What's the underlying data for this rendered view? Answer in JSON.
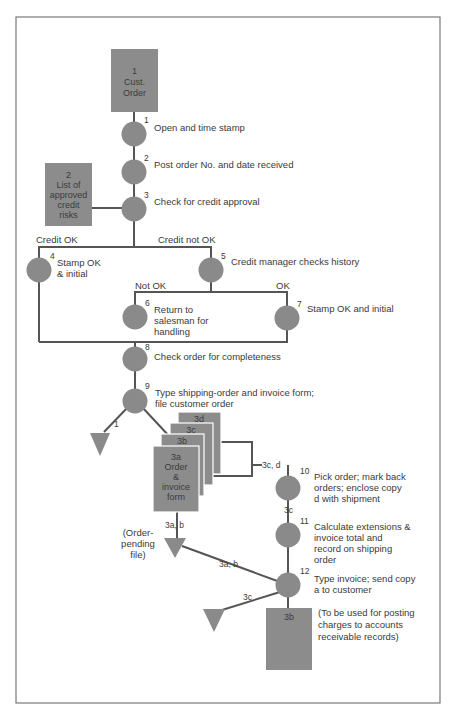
{
  "documents": {
    "cust_order": {
      "number": "1",
      "line1": "Cust.",
      "line2": "Order"
    },
    "credit_list": {
      "number": "2",
      "lines": [
        "List of",
        "approved",
        "credit",
        "risks"
      ]
    },
    "form_copies": {
      "d": "3d",
      "c": "3c",
      "b": "3b",
      "a_number": "3a",
      "a_lines": [
        "Order",
        "&",
        "invoice",
        "form"
      ]
    },
    "copy_3b_final": {
      "label": "3b",
      "note_lines": [
        "(To be used for posting",
        "charges to accounts",
        "receivable records)"
      ]
    }
  },
  "steps": [
    {
      "number": "1",
      "lines": [
        "Open and time stamp"
      ]
    },
    {
      "number": "2",
      "lines": [
        "Post order No. and date received"
      ]
    },
    {
      "number": "3",
      "lines": [
        "Check for credit approval"
      ]
    },
    {
      "number": "4",
      "lines": [
        "Stamp OK",
        "& initial"
      ]
    },
    {
      "number": "5",
      "lines": [
        "Credit manager checks history"
      ]
    },
    {
      "number": "6",
      "lines": [
        "Return to",
        "salesman for",
        "handling"
      ]
    },
    {
      "number": "7",
      "lines": [
        "Stamp OK and initial"
      ]
    },
    {
      "number": "8",
      "lines": [
        "Check order for completeness"
      ]
    },
    {
      "number": "9",
      "lines": [
        "Type shipping-order and invoice form;",
        "file customer order"
      ]
    },
    {
      "number": "10",
      "lines": [
        "Pick order; mark back",
        "orders; enclose copy",
        "d with shipment"
      ]
    },
    {
      "number": "11",
      "lines": [
        "Calculate extensions &",
        "invoice total and",
        "record on shipping",
        "order"
      ]
    },
    {
      "number": "12",
      "lines": [
        "Type invoice; send copy",
        "a to customer"
      ]
    }
  ],
  "branches": {
    "credit_ok": "Credit OK",
    "credit_not_ok": "Credit not OK",
    "not_ok": "Not OK",
    "ok": "OK"
  },
  "flow_labels": {
    "to_file_1": "1",
    "copies_3c_d": "3c, d",
    "copy_3c_a": "3c",
    "copies_3ab_a": "3a, b",
    "copies_3ab_b": "3a, b",
    "copy_3c_b": "3c"
  },
  "files": {
    "order_pending_lines": [
      "(Order-",
      "pending",
      "file)"
    ]
  },
  "colors": {
    "shape": "#8a8a8a",
    "line": "#555555",
    "frame": "#7a7a7a",
    "text": "#3a3a3a"
  }
}
